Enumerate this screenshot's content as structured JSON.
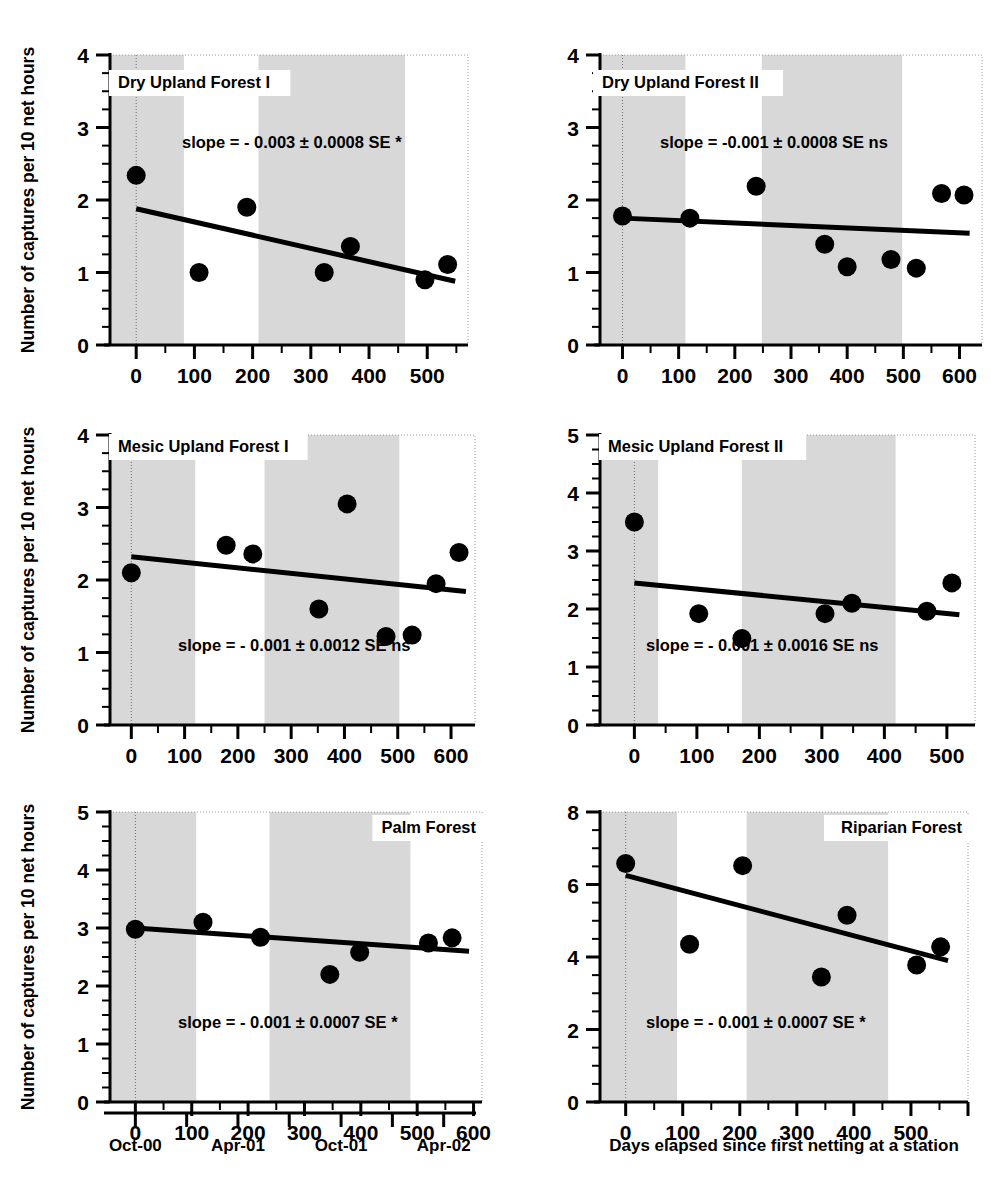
{
  "figure": {
    "y_axis_label": "Number of captures per 10 net hours",
    "x_axis_label": "Days elapsed since first netting at a station",
    "date_axis": {
      "labels": [
        "Oct-00",
        "Apr-01",
        "Oct-01",
        "Apr-02"
      ],
      "label_days": [
        0,
        182,
        365,
        547
      ],
      "tick_days": [
        0,
        91,
        182,
        273,
        365,
        456,
        547
      ]
    }
  },
  "chart_data": [
    {
      "type": "scatter",
      "title": "Dry Upland Forest I",
      "xlabel": "Days elapsed since first netting at a station",
      "ylabel": "Number of captures per 10 net hours",
      "xlim": [
        -45,
        570
      ],
      "ylim": [
        0,
        4
      ],
      "xticks": [
        0,
        100,
        200,
        300,
        400,
        500
      ],
      "yticks": [
        0,
        1,
        2,
        3,
        4
      ],
      "y_minor_step": 0.25,
      "grid": false,
      "annotation": "slope =  - 0.003 ± 0.0008 SE *",
      "slope": -0.003,
      "se": 0.0008,
      "significance": "*",
      "points": [
        {
          "x": 0,
          "y": 2.34
        },
        {
          "x": 108,
          "y": 1.0
        },
        {
          "x": 190,
          "y": 1.9
        },
        {
          "x": 323,
          "y": 1.0
        },
        {
          "x": 368,
          "y": 1.36
        },
        {
          "x": 496,
          "y": 0.9
        },
        {
          "x": 535,
          "y": 1.11
        }
      ],
      "fit": {
        "x0": 0,
        "y0": 1.88,
        "x1": 548,
        "y1": 0.88
      },
      "bands": [
        [
          -45,
          82
        ],
        [
          210,
          462
        ]
      ]
    },
    {
      "type": "scatter",
      "title": "Dry Upland Forest II",
      "xlabel": "Days elapsed since first netting at a station",
      "ylabel": "Number of captures per 10 net hours",
      "xlim": [
        -40,
        640
      ],
      "ylim": [
        0,
        4
      ],
      "xticks": [
        0,
        100,
        200,
        300,
        400,
        500,
        600
      ],
      "yticks": [
        0,
        1,
        2,
        3,
        4
      ],
      "y_minor_step": 0.25,
      "grid": false,
      "annotation": "slope =  -0.001 ± 0.0008 SE ns",
      "slope": -0.001,
      "se": 0.0008,
      "significance": "ns",
      "points": [
        {
          "x": 0,
          "y": 1.78
        },
        {
          "x": 120,
          "y": 1.75
        },
        {
          "x": 238,
          "y": 2.19
        },
        {
          "x": 360,
          "y": 1.39
        },
        {
          "x": 400,
          "y": 1.08
        },
        {
          "x": 478,
          "y": 1.18
        },
        {
          "x": 523,
          "y": 1.06
        },
        {
          "x": 568,
          "y": 2.09
        },
        {
          "x": 608,
          "y": 2.07
        }
      ],
      "fit": {
        "x0": 0,
        "y0": 1.75,
        "x1": 618,
        "y1": 1.54
      },
      "bands": [
        [
          -40,
          112
        ],
        [
          248,
          498
        ]
      ]
    },
    {
      "type": "scatter",
      "title": "Mesic Upland Forest I",
      "xlabel": "Days elapsed since first netting at a station",
      "ylabel": "Number of captures per 10 net hours",
      "xlim": [
        -40,
        645
      ],
      "ylim": [
        0,
        4
      ],
      "xticks": [
        0,
        100,
        200,
        300,
        400,
        500,
        600
      ],
      "yticks": [
        0,
        1,
        2,
        3,
        4
      ],
      "y_minor_step": 0.25,
      "grid": false,
      "annotation": "slope =  - 0.001 ± 0.0012 SE ns",
      "slope": -0.001,
      "se": 0.0012,
      "significance": "ns",
      "points": [
        {
          "x": 0,
          "y": 2.1
        },
        {
          "x": 178,
          "y": 2.48
        },
        {
          "x": 228,
          "y": 2.36
        },
        {
          "x": 352,
          "y": 1.6
        },
        {
          "x": 405,
          "y": 3.05
        },
        {
          "x": 478,
          "y": 1.22
        },
        {
          "x": 527,
          "y": 1.24
        },
        {
          "x": 572,
          "y": 1.95
        },
        {
          "x": 615,
          "y": 2.38
        }
      ],
      "fit": {
        "x0": 0,
        "y0": 2.32,
        "x1": 628,
        "y1": 1.84
      },
      "bands": [
        [
          -40,
          120
        ],
        [
          250,
          503
        ]
      ]
    },
    {
      "type": "scatter",
      "title": "Mesic Upland Forest II",
      "xlabel": "Days elapsed since first netting at a station",
      "ylabel": "Number of captures per 10 net hours",
      "xlim": [
        -55,
        545
      ],
      "ylim": [
        0,
        5
      ],
      "xticks": [
        0,
        100,
        200,
        300,
        400,
        500
      ],
      "yticks": [
        0,
        1,
        2,
        3,
        4,
        5
      ],
      "y_minor_step": 0.25,
      "grid": false,
      "annotation": "slope =  - 0.001 ± 0.0016 SE ns",
      "slope": -0.001,
      "se": 0.0016,
      "significance": "ns",
      "points": [
        {
          "x": 0,
          "y": 3.5
        },
        {
          "x": 103,
          "y": 1.92
        },
        {
          "x": 172,
          "y": 1.49
        },
        {
          "x": 305,
          "y": 1.92
        },
        {
          "x": 348,
          "y": 2.1
        },
        {
          "x": 468,
          "y": 1.96
        },
        {
          "x": 508,
          "y": 2.45
        }
      ],
      "fit": {
        "x0": 0,
        "y0": 2.45,
        "x1": 520,
        "y1": 1.9
      },
      "bands": [
        [
          -55,
          38
        ],
        [
          172,
          418
        ]
      ]
    },
    {
      "type": "scatter",
      "title": "Palm Forest",
      "xlabel": "Days elapsed since first netting at a station",
      "ylabel": "Number of captures per 10 net hours",
      "xlim": [
        -45,
        615
      ],
      "ylim": [
        0,
        5
      ],
      "xticks": [
        0,
        100,
        200,
        300,
        400,
        500,
        600
      ],
      "yticks": [
        0,
        1,
        2,
        3,
        4,
        5
      ],
      "y_minor_step": 0.25,
      "grid": false,
      "annotation": "slope =  - 0.001 ± 0.0007 SE *",
      "slope": -0.001,
      "se": 0.0007,
      "significance": "*",
      "points": [
        {
          "x": 0,
          "y": 2.98
        },
        {
          "x": 120,
          "y": 3.1
        },
        {
          "x": 222,
          "y": 2.84
        },
        {
          "x": 345,
          "y": 2.2
        },
        {
          "x": 398,
          "y": 2.58
        },
        {
          "x": 520,
          "y": 2.74
        },
        {
          "x": 562,
          "y": 2.83
        }
      ],
      "fit": {
        "x0": 0,
        "y0": 3.0,
        "x1": 592,
        "y1": 2.6
      },
      "bands": [
        [
          -45,
          108
        ],
        [
          238,
          488
        ]
      ]
    },
    {
      "type": "scatter",
      "title": "Riparian Forest",
      "xlabel": "Days elapsed since first netting at a station",
      "ylabel": "Number of captures per 10 net hours",
      "xlim": [
        -45,
        600
      ],
      "ylim": [
        0,
        8
      ],
      "xticks": [
        0,
        100,
        200,
        300,
        400,
        500
      ],
      "yticks": [
        0,
        2,
        4,
        6,
        8
      ],
      "y_minor_step": 0.5,
      "grid": false,
      "annotation": "slope =  - 0.001 ± 0.0007 SE *",
      "slope": -0.001,
      "se": 0.0007,
      "significance": "*",
      "points": [
        {
          "x": 0,
          "y": 6.58
        },
        {
          "x": 112,
          "y": 4.35
        },
        {
          "x": 205,
          "y": 6.52
        },
        {
          "x": 343,
          "y": 3.45
        },
        {
          "x": 388,
          "y": 5.15
        },
        {
          "x": 510,
          "y": 3.78
        },
        {
          "x": 552,
          "y": 4.28
        }
      ],
      "fit": {
        "x0": 0,
        "y0": 6.25,
        "x1": 565,
        "y1": 3.9
      },
      "bands": [
        [
          -45,
          90
        ],
        [
          212,
          460
        ]
      ]
    }
  ]
}
